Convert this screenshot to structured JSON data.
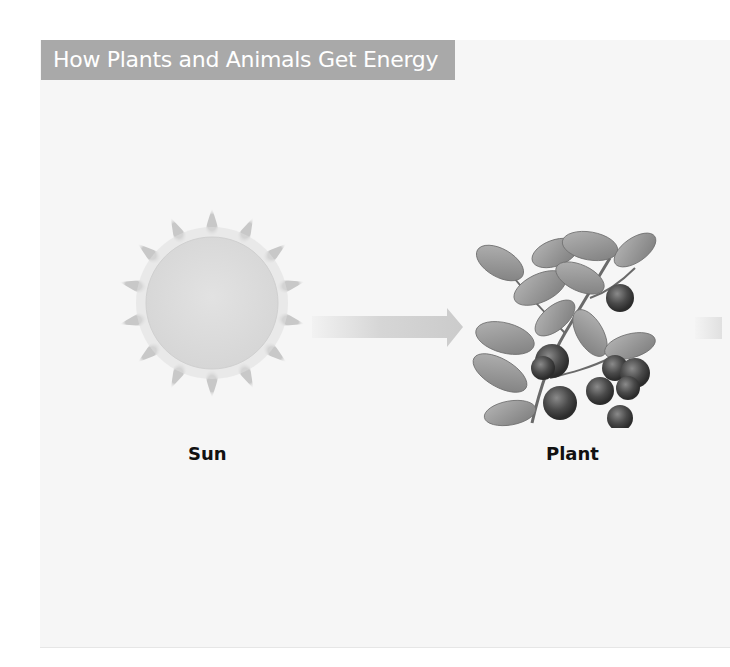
{
  "title": "How Plants and Animals Get Energy",
  "nodes": [
    {
      "id": "sun",
      "label": "Sun",
      "icon": "sun-icon"
    },
    {
      "id": "plant",
      "label": "Plant",
      "icon": "blueberry-plant-icon"
    }
  ],
  "edges": [
    {
      "from": "sun",
      "to": "plant",
      "icon": "right-arrow-icon"
    },
    {
      "from": "plant",
      "to": "offscreen",
      "icon": "right-arrow-icon"
    }
  ],
  "colors": {
    "title_bar": "#a9a9a9",
    "title_text": "#ffffff",
    "panel_bg": "#f6f6f6",
    "sun_disc": "#dcdcdc",
    "arrow": "#cfcfcf",
    "label_text": "#111111"
  }
}
